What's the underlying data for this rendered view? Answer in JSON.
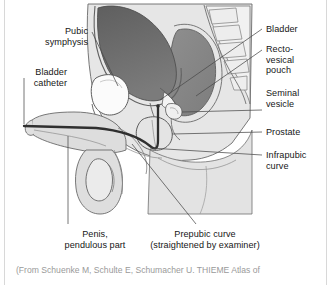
{
  "figure": {
    "labels": {
      "pubic_symphysis": "Pubic\nsymphysis",
      "bladder_catheter": "Bladder\ncatheter",
      "bladder": "Bladder",
      "rectovesical_pouch": "Recto-\nvesical\npouch",
      "seminal_vesicle": "Seminal\nvesicle",
      "prostate": "Prostate",
      "infrapubic_curve": "Infrapubic\ncurve",
      "penis_pendulous_part": "Penis,\npendulous part",
      "prepubic_curve": "Prepubic curve\n(straightened by examiner)"
    },
    "caption": "(From Schuenke M, Schulte E, Schumacher U. THIEME Atlas of",
    "colors": {
      "background": "#ffffff",
      "bladder_fill": "#6e6e6e",
      "rectum_fill": "#8a8a8a",
      "soft_tissue_fill": "#d9d9d9",
      "bone_fill": "#efefef",
      "outline": "#5a5a5a",
      "catheter": "#2f2f2f",
      "leader_line": "#4a4a4a",
      "label_text": "#161616",
      "caption_text": "#9a9a9a",
      "edge_rule": "#d8d8d8"
    }
  }
}
